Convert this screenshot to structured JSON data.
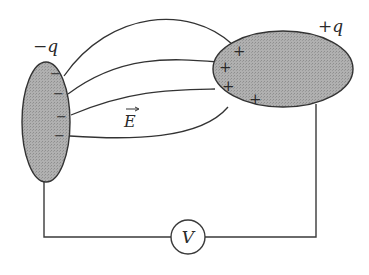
{
  "diagram": {
    "type": "electrostatics-capacitor-conductors",
    "labels": {
      "negative_charge": "−q",
      "positive_charge": "+q",
      "field": "E",
      "voltmeter": "V"
    },
    "negative_conductor": {
      "charge_symbols": [
        "−",
        "−",
        "−",
        "−"
      ]
    },
    "positive_conductor": {
      "charge_symbols": [
        "+",
        "+",
        "+",
        "+"
      ]
    },
    "field_line_count": 4,
    "colors": {
      "conductor_fill": "#a8a8a8",
      "stroke": "#333333",
      "background": "#ffffff"
    }
  }
}
